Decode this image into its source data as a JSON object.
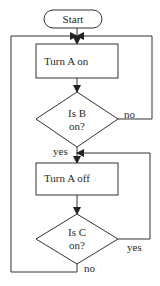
{
  "flowchart": {
    "start": {
      "label": "Start"
    },
    "steps": [
      {
        "id": "turn-a-on",
        "label": "Turn A on"
      },
      {
        "id": "turn-a-off",
        "label": "Turn A off"
      }
    ],
    "decisions": [
      {
        "id": "is-b-on",
        "line1": "Is B",
        "line2": "on?",
        "yes_label": "yes",
        "no_label": "no"
      },
      {
        "id": "is-c-on",
        "line1": "Is C",
        "line2": "on?",
        "yes_label": "yes",
        "no_label": "no"
      }
    ]
  },
  "colors": {
    "stroke": "#333333",
    "text": "#2a2a2a",
    "background": "#ffffff"
  }
}
